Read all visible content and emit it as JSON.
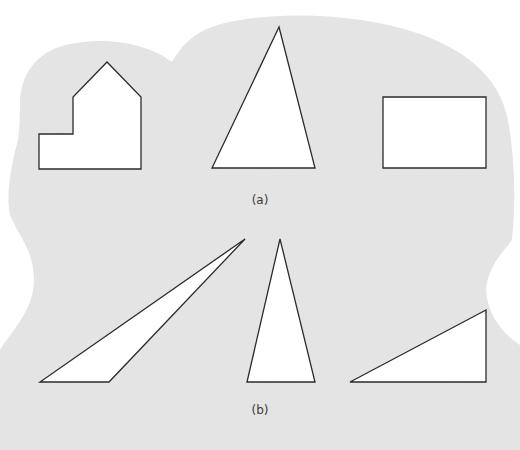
{
  "figure": {
    "background_color": "#e6e6e6",
    "shape_fill": "#ffffff",
    "shape_stroke": "#2b2b2b",
    "panels": [
      {
        "label": "(a)",
        "shapes": [
          {
            "name": "house-shaped-polygon",
            "kind": "irregular heptagon"
          },
          {
            "name": "acute-triangle",
            "kind": "triangle"
          },
          {
            "name": "rectangle",
            "kind": "rectangle"
          }
        ]
      },
      {
        "label": "(b)",
        "shapes": [
          {
            "name": "obtuse-triangle",
            "kind": "triangle"
          },
          {
            "name": "isosceles-triangle",
            "kind": "triangle"
          },
          {
            "name": "right-triangle",
            "kind": "triangle"
          }
        ]
      }
    ]
  }
}
